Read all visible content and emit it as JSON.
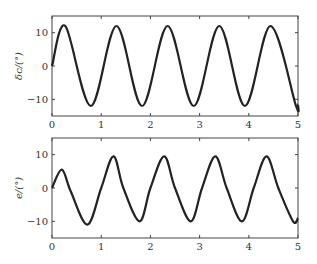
{
  "chart_data": [
    {
      "type": "line",
      "title": "",
      "xlabel": "",
      "ylabel": "δc/(°)",
      "xlim": [
        0,
        5
      ],
      "ylim": [
        -15,
        15
      ],
      "xticks": [
        "0",
        "1",
        "2",
        "3",
        "4",
        "5"
      ],
      "yticks": [
        "-10",
        "0",
        "10"
      ],
      "grid": false,
      "series": [
        {
          "name": "δc",
          "description": "sinusoid, amplitude ~12°, period ~1.04",
          "x": [
            0,
            0.27,
            0.79,
            1.31,
            1.83,
            2.35,
            2.88,
            3.4,
            3.92,
            4.44,
            4.96,
            5.0
          ],
          "y": [
            0,
            12,
            -12,
            12,
            -12,
            12,
            -12,
            12,
            -12,
            12,
            -12,
            -11.5
          ]
        }
      ]
    },
    {
      "type": "line",
      "title": "",
      "xlabel": "",
      "ylabel": "e/(°)",
      "xlim": [
        0,
        5
      ],
      "ylim": [
        -15,
        15
      ],
      "xticks": [
        "0",
        "1",
        "2",
        "3",
        "4",
        "5"
      ],
      "yticks": [
        "-10",
        "0",
        "10"
      ],
      "grid": false,
      "series": [
        {
          "name": "e",
          "x": [
            0,
            0.2,
            0.38,
            0.72,
            1.0,
            1.25,
            1.45,
            1.78,
            2.0,
            2.28,
            2.5,
            2.82,
            3.05,
            3.32,
            3.55,
            3.86,
            4.1,
            4.36,
            4.6,
            4.9,
            5.0
          ],
          "y": [
            0,
            5.5,
            -1,
            -11,
            0,
            9.5,
            0,
            -10,
            0,
            9.5,
            0,
            -10,
            0,
            9.5,
            0,
            -10,
            0,
            9.5,
            0,
            -10,
            -9
          ]
        }
      ]
    }
  ],
  "labels": {
    "top_ylabel": "δc/(°)",
    "bottom_ylabel": "e/(°)",
    "xticks": [
      "0",
      "1",
      "2",
      "3",
      "4",
      "5"
    ],
    "yticks": [
      "10",
      "0",
      "−10"
    ]
  }
}
